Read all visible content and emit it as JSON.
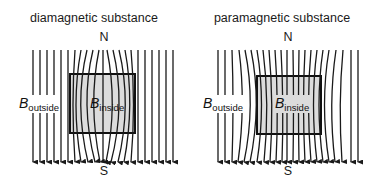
{
  "panels": [
    {
      "title": "diamagnetic substance",
      "north_label": "N",
      "south_label": "S",
      "outside_label": {
        "symbol": "B",
        "subscript": "outside"
      },
      "inside_label": {
        "symbol": "B",
        "subscript": "inside"
      },
      "field_behavior": "field lines bend around / are expelled from the substance"
    },
    {
      "title": "paramagnetic substance",
      "north_label": "N",
      "south_label": "S",
      "outside_label": {
        "symbol": "B",
        "subscript": "outside"
      },
      "inside_label": {
        "symbol": "B",
        "subscript": "inside"
      },
      "field_behavior": "field lines are concentrated into the substance"
    }
  ],
  "colors": {
    "line": "#1a1a1a",
    "substance_fill": "#dcdcdc",
    "substance_border": "#111111"
  }
}
